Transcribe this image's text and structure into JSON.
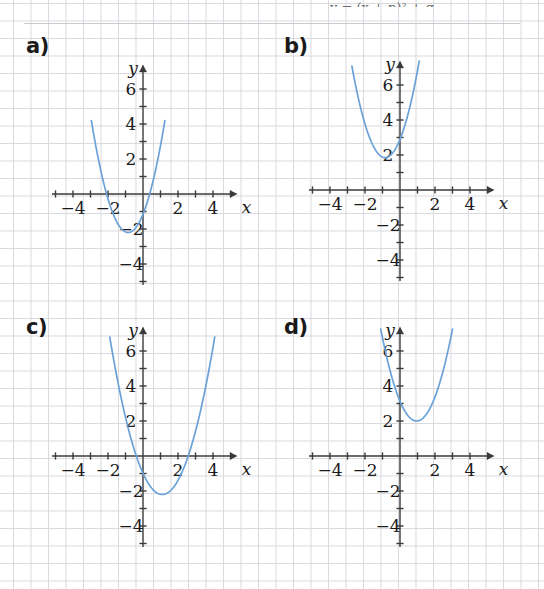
{
  "page": {
    "background": "#ffffff",
    "grid_color": "#d9d9de",
    "curve_color": "#6aa2d8",
    "axis_color": "#3a3a3a",
    "cropped_header_text": "y = (x + p)² + q"
  },
  "axes": {
    "x_name": "x",
    "y_name": "y",
    "x_ticklabels": [
      "−4",
      "−2",
      "2",
      "4"
    ],
    "x_tickvalues": [
      -4,
      -2,
      2,
      4
    ],
    "y_ticklabels": [
      "6",
      "4",
      "2",
      "−2",
      "−4"
    ],
    "y_tickvalues": [
      6,
      4,
      2,
      -2,
      -4
    ],
    "xlim": [
      -5.2,
      5.4
    ],
    "ylim": [
      -5.2,
      7.4
    ],
    "unit_px": 17.5
  },
  "panels": [
    {
      "id": "a",
      "label": "a)",
      "chart_data": {
        "type": "line",
        "title": "a)",
        "xlabel": "x",
        "ylabel": "y",
        "xlim": [
          -5.2,
          5.4
        ],
        "ylim": [
          -5.2,
          7.4
        ],
        "grid": true,
        "curve_kind": "parabola",
        "opens": "up",
        "vertex": [
          -0.85,
          -2.2
        ],
        "a": 1.45,
        "y_intercept": -1.15,
        "roots": [
          -2.08,
          0.38
        ],
        "x_domain_drawn": [
          -2.95,
          1.25
        ],
        "equation": "y = 1.45(x + 0.85)² − 2.2"
      }
    },
    {
      "id": "b",
      "label": "b)",
      "chart_data": {
        "type": "line",
        "title": "b)",
        "xlabel": "x",
        "ylabel": "y",
        "xlim": [
          -5.2,
          5.4
        ],
        "ylim": [
          -5.2,
          7.4
        ],
        "grid": true,
        "curve_kind": "parabola",
        "opens": "up",
        "vertex": [
          -0.85,
          1.85
        ],
        "a": 1.45,
        "y_intercept": 2.9,
        "roots": [],
        "x_domain_drawn": [
          -2.75,
          1.1
        ],
        "equation": "y = 1.45(x + 0.85)² + 1.85"
      }
    },
    {
      "id": "c",
      "label": "c)",
      "chart_data": {
        "type": "line",
        "title": "c)",
        "xlabel": "x",
        "ylabel": "y",
        "xlim": [
          -5.2,
          5.4
        ],
        "ylim": [
          -5.2,
          7.4
        ],
        "grid": true,
        "curve_kind": "parabola",
        "opens": "up",
        "vertex": [
          1.1,
          -2.2
        ],
        "a": 1.0,
        "y_intercept": -0.99,
        "roots": [
          -0.38,
          2.58
        ],
        "x_domain_drawn": [
          -1.9,
          4.1
        ],
        "equation": "y = (x − 1.1)² − 2.2"
      }
    },
    {
      "id": "d",
      "label": "d)",
      "chart_data": {
        "type": "line",
        "title": "d)",
        "xlabel": "x",
        "ylabel": "y",
        "xlim": [
          -5.2,
          5.4
        ],
        "ylim": [
          -5.2,
          7.4
        ],
        "grid": true,
        "curve_kind": "parabola",
        "opens": "up",
        "vertex": [
          0.95,
          2.0
        ],
        "a": 1.25,
        "y_intercept": 3.13,
        "roots": [],
        "x_domain_drawn": [
          -1.1,
          3.0
        ],
        "equation": "y = 1.25(x − 0.95)² + 2"
      }
    }
  ]
}
